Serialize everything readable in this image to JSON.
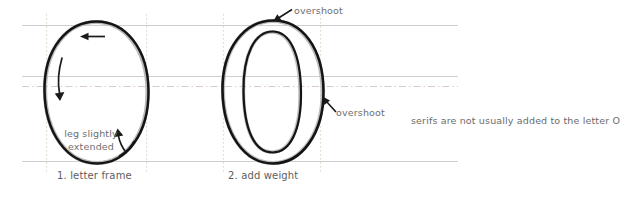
{
  "figure": {
    "title_visible": false,
    "background_color": "#ffffff",
    "width": 643,
    "height": 197,
    "guide_color": "#cfcfcf",
    "guide_dash_color": "#d6c9cb",
    "vertical_guide_color": "#d9d4c9",
    "stroke_color": "#1a1a1a",
    "text_color": "#6e6e6e"
  },
  "guides": {
    "horizontal": [
      {
        "name": "cap-line",
        "y": 25,
        "style": "solid"
      },
      {
        "name": "x-line-upper",
        "y": 76,
        "style": "solid"
      },
      {
        "name": "x-line-lower",
        "y": 87,
        "style": "dash-dot"
      },
      {
        "name": "baseline",
        "y": 161,
        "style": "solid"
      }
    ],
    "vertical": [
      {
        "name": "frame-left-guide",
        "x": 46,
        "style": "dotted"
      },
      {
        "name": "frame-right-guide",
        "x": 146,
        "style": "dotted"
      },
      {
        "name": "weight-left-guide",
        "x": 223,
        "style": "dotted"
      },
      {
        "name": "weight-right-guide",
        "x": 320,
        "style": "dotted"
      }
    ]
  },
  "steps": [
    {
      "number": "1",
      "label": "1. letter frame"
    },
    {
      "number": "2",
      "label": "2. add weight"
    }
  ],
  "annotations": {
    "leg_extended": "leg slightly\nextended",
    "leg_extended_line1": "leg slightly",
    "leg_extended_line2": "extended",
    "overshoot_top": "overshoot",
    "overshoot_right": "overshoot",
    "serif_note": "serifs are not usually added to the letter O"
  },
  "stroke_arrows": [
    {
      "name": "top-direction-arrow",
      "direction": "left"
    },
    {
      "name": "left-downstroke-arrow",
      "direction": "down"
    },
    {
      "name": "leg-callout-arrow",
      "direction": "up-right"
    },
    {
      "name": "overshoot-top-arrow",
      "direction": "down-left"
    },
    {
      "name": "overshoot-right-arrow",
      "direction": "up-left"
    }
  ]
}
